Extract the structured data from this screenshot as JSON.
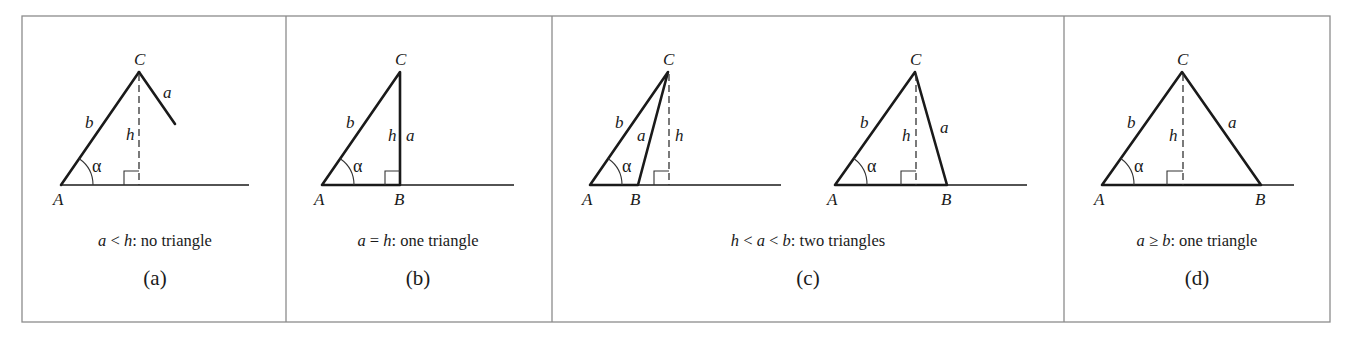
{
  "figure": {
    "panels": [
      {
        "id": "a",
        "sub_label": "(a)",
        "caption": {
          "var1": "a",
          "op1": " < ",
          "var2": "h",
          "rest": ": no triangle"
        },
        "vertex_labels": {
          "A": "A",
          "C": "C"
        },
        "side_labels": {
          "b": "b",
          "a": "a",
          "h": "h"
        },
        "angle_label": "α"
      },
      {
        "id": "b",
        "sub_label": "(b)",
        "caption": {
          "var1": "a",
          "op1": " = ",
          "var2": "h",
          "rest": ": one triangle"
        },
        "vertex_labels": {
          "A": "A",
          "B": "B",
          "C": "C"
        },
        "side_labels": {
          "b": "b",
          "a": "a",
          "h": "h"
        },
        "angle_label": "α"
      },
      {
        "id": "c",
        "sub_label": "(c)",
        "caption": {
          "var1": "h",
          "op1": " < ",
          "var2": "a",
          "op2": " < ",
          "var3": "b",
          "rest": ": two triangles"
        },
        "triangles": [
          {
            "vertex_labels": {
              "A": "A",
              "B": "B",
              "C": "C"
            },
            "side_labels": {
              "b": "b",
              "a": "a",
              "h": "h"
            },
            "angle_label": "α"
          },
          {
            "vertex_labels": {
              "A": "A",
              "B": "B",
              "C": "C"
            },
            "side_labels": {
              "b": "b",
              "a": "a",
              "h": "h"
            },
            "angle_label": "α"
          }
        ]
      },
      {
        "id": "d",
        "sub_label": "(d)",
        "caption": {
          "var1": "a",
          "op1": " ≥ ",
          "var2": "b",
          "rest": ": one triangle"
        },
        "vertex_labels": {
          "A": "A",
          "B": "B",
          "C": "C"
        },
        "side_labels": {
          "b": "b",
          "a": "a",
          "h": "h"
        },
        "angle_label": "α"
      }
    ]
  }
}
